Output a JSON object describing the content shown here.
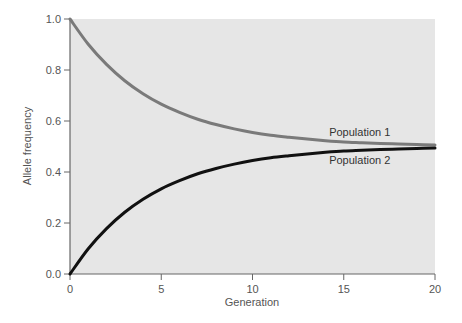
{
  "chart_data": {
    "type": "line",
    "title": "",
    "xlabel": "Generation",
    "ylabel": "Allele frequency",
    "xlim": [
      0,
      20
    ],
    "ylim": [
      0,
      1.0
    ],
    "grid": false,
    "x_ticks": [
      0,
      5,
      10,
      15,
      20
    ],
    "x_tick_labels": [
      "0",
      "5",
      "10",
      "15",
      "20"
    ],
    "y_ticks": [
      0,
      0.2,
      0.4,
      0.6,
      0.8,
      1.0
    ],
    "y_tick_labels": [
      "0.0",
      "0.2",
      "0.4",
      "0.6",
      "0.8",
      "1.0"
    ],
    "x": [
      0,
      1,
      2,
      3,
      4,
      5,
      6,
      7,
      8,
      9,
      10,
      11,
      12,
      13,
      14,
      15,
      16,
      17,
      18,
      19,
      20
    ],
    "series": [
      {
        "name": "Population 1",
        "color": "#7a7a7a",
        "values": [
          1.0,
          0.901,
          0.822,
          0.758,
          0.707,
          0.666,
          0.634,
          0.607,
          0.586,
          0.569,
          0.555,
          0.544,
          0.536,
          0.529,
          0.523,
          0.518,
          0.515,
          0.512,
          0.51,
          0.508,
          0.506
        ]
      },
      {
        "name": "Population 2",
        "color": "#111111",
        "values": [
          0.0,
          0.099,
          0.178,
          0.242,
          0.293,
          0.334,
          0.366,
          0.393,
          0.414,
          0.431,
          0.445,
          0.456,
          0.464,
          0.471,
          0.477,
          0.482,
          0.485,
          0.488,
          0.49,
          0.492,
          0.494
        ]
      }
    ],
    "plot_background": "#e6e6e6"
  }
}
